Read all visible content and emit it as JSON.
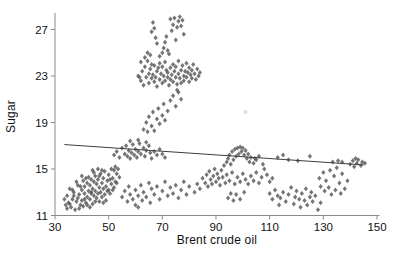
{
  "chart_data": {
    "type": "scatter",
    "title": "",
    "xlabel": "Brent crude oil",
    "ylabel": "Sugar",
    "xlim": [
      30,
      150
    ],
    "ylim": [
      11,
      28.3
    ],
    "x_ticks": [
      30,
      50,
      70,
      90,
      110,
      130,
      150
    ],
    "y_ticks": [
      11,
      15,
      19,
      23,
      27
    ],
    "grid": false,
    "legend": "none",
    "marker": {
      "shape": "diamond",
      "color": "#57575a",
      "size": 4
    },
    "axis_color": "#8a8a8a",
    "text_color": "#111111",
    "trendline": {
      "x1": 33.5,
      "y1": 17.1,
      "x2": 145,
      "y2": 15.35,
      "color": "#3d3d3d"
    },
    "points": [
      [
        33.5,
        12.4
      ],
      [
        34,
        11.9
      ],
      [
        34.5,
        12.7
      ],
      [
        35,
        12.1
      ],
      [
        35.5,
        13.3
      ],
      [
        36,
        11.7
      ],
      [
        36.5,
        12.4
      ],
      [
        37,
        13.0
      ],
      [
        37.5,
        11.5
      ],
      [
        38,
        12.2
      ],
      [
        38.5,
        13.6
      ],
      [
        39,
        12.8
      ],
      [
        39.5,
        11.9
      ],
      [
        40,
        13.2
      ],
      [
        40,
        12.3
      ],
      [
        40.5,
        14.0
      ],
      [
        41,
        12.9
      ],
      [
        41,
        13.5
      ],
      [
        41.5,
        12.1
      ],
      [
        42,
        13.8
      ],
      [
        42,
        12.6
      ],
      [
        42.5,
        13.1
      ],
      [
        42.5,
        14.3
      ],
      [
        43,
        12.4
      ],
      [
        43,
        13.6
      ],
      [
        43.5,
        12.9
      ],
      [
        43.5,
        14.1
      ],
      [
        44,
        13.3
      ],
      [
        44,
        12.0
      ],
      [
        44.5,
        13.9
      ],
      [
        44.5,
        12.7
      ],
      [
        45,
        14.4
      ],
      [
        45,
        13.1
      ],
      [
        45.5,
        12.5
      ],
      [
        45.5,
        13.7
      ],
      [
        46,
        14.1
      ],
      [
        46,
        12.9
      ],
      [
        46.5,
        13.4
      ],
      [
        46.5,
        12.2
      ],
      [
        47,
        14.6
      ],
      [
        47,
        13.0
      ],
      [
        47.5,
        13.8
      ],
      [
        47.5,
        12.6
      ],
      [
        48,
        14.2
      ],
      [
        48,
        13.3
      ],
      [
        48.5,
        12.8
      ],
      [
        48.5,
        14.8
      ],
      [
        49,
        13.5
      ],
      [
        49,
        12.3
      ],
      [
        49.5,
        14.0
      ],
      [
        50,
        13.2
      ],
      [
        50,
        14.5
      ],
      [
        50.5,
        12.9
      ],
      [
        51,
        13.7
      ],
      [
        51,
        15.0
      ],
      [
        51.5,
        14.2
      ],
      [
        52,
        13.4
      ],
      [
        52,
        14.9
      ],
      [
        52.5,
        15.2
      ],
      [
        53,
        14.6
      ],
      [
        53.5,
        15.0
      ],
      [
        54,
        14.3
      ],
      [
        39,
        11.6
      ],
      [
        40.5,
        11.8
      ],
      [
        43,
        11.7
      ],
      [
        37,
        12.7
      ],
      [
        38,
        13.9
      ],
      [
        36.5,
        13.2
      ],
      [
        35.5,
        12.0
      ],
      [
        48,
        12.1
      ],
      [
        50.5,
        14.1
      ],
      [
        41.5,
        14.2
      ],
      [
        44.5,
        14.7
      ],
      [
        46,
        15.0
      ],
      [
        49.5,
        13.1
      ],
      [
        34.5,
        11.6
      ],
      [
        52.5,
        13.9
      ],
      [
        42,
        11.9
      ],
      [
        45,
        12.2
      ],
      [
        47.5,
        14.9
      ],
      [
        39.5,
        13.5
      ],
      [
        41,
        12.4
      ],
      [
        43.5,
        13.0
      ],
      [
        51.5,
        13.2
      ],
      [
        38.5,
        12.5
      ],
      [
        40,
        14.4
      ],
      [
        44,
        14.9
      ],
      [
        46.5,
        14.4
      ],
      [
        53,
        13.8
      ],
      [
        52,
        16.2
      ],
      [
        53,
        16.5
      ],
      [
        54,
        16.0
      ],
      [
        55,
        16.8
      ],
      [
        56,
        16.3
      ],
      [
        56.5,
        17.0
      ],
      [
        57,
        16.1
      ],
      [
        57.5,
        16.6
      ],
      [
        58,
        15.9
      ],
      [
        58.5,
        16.4
      ],
      [
        59,
        17.1
      ],
      [
        59.5,
        16.2
      ],
      [
        60,
        16.7
      ],
      [
        60.5,
        16.0
      ],
      [
        61,
        16.5
      ],
      [
        61.5,
        17.2
      ],
      [
        62,
        16.3
      ],
      [
        63,
        16.8
      ],
      [
        63.5,
        16.1
      ],
      [
        64,
        16.6
      ],
      [
        65,
        17.0
      ],
      [
        65.5,
        16.4
      ],
      [
        66,
        15.9
      ],
      [
        67,
        16.5
      ],
      [
        68,
        16.2
      ],
      [
        69,
        16.7
      ],
      [
        70,
        16.3
      ],
      [
        71,
        16.0
      ],
      [
        58,
        17.4
      ],
      [
        61,
        17.5
      ],
      [
        64,
        17.3
      ],
      [
        63,
        18.4
      ],
      [
        64,
        19.0
      ],
      [
        64.5,
        18.2
      ],
      [
        65,
        19.5
      ],
      [
        66,
        18.7
      ],
      [
        66.5,
        19.9
      ],
      [
        67,
        18.3
      ],
      [
        68,
        19.3
      ],
      [
        68.5,
        20.2
      ],
      [
        69,
        18.9
      ],
      [
        70,
        19.6
      ],
      [
        70.5,
        20.6
      ],
      [
        71,
        19.2
      ],
      [
        72,
        20.0
      ],
      [
        73,
        20.9
      ],
      [
        74,
        21.3
      ],
      [
        75,
        20.4
      ],
      [
        76,
        21.6
      ],
      [
        77,
        21.0
      ],
      [
        75.5,
        21.8
      ],
      [
        61,
        23.0
      ],
      [
        62,
        22.6
      ],
      [
        62.5,
        23.4
      ],
      [
        63,
        22.2
      ],
      [
        63.5,
        23.8
      ],
      [
        64,
        22.9
      ],
      [
        64.5,
        24.3
      ],
      [
        65,
        23.2
      ],
      [
        65,
        22.4
      ],
      [
        65.5,
        23.6
      ],
      [
        66,
        22.8
      ],
      [
        66,
        24.0
      ],
      [
        66.5,
        23.1
      ],
      [
        67,
        22.5
      ],
      [
        67,
        23.9
      ],
      [
        67.5,
        22.9
      ],
      [
        68,
        23.4
      ],
      [
        68,
        22.1
      ],
      [
        68.5,
        23.7
      ],
      [
        69,
        22.7
      ],
      [
        69,
        24.1
      ],
      [
        69.5,
        23.2
      ],
      [
        70,
        22.4
      ],
      [
        70,
        23.8
      ],
      [
        70.5,
        23.0
      ],
      [
        71,
        22.6
      ],
      [
        71,
        24.2
      ],
      [
        71.5,
        23.5
      ],
      [
        72,
        22.9
      ],
      [
        72,
        23.3
      ],
      [
        72.5,
        22.2
      ],
      [
        73,
        23.7
      ],
      [
        73,
        22.7
      ],
      [
        73.5,
        23.1
      ],
      [
        74,
        24.0
      ],
      [
        74,
        22.5
      ],
      [
        74.5,
        23.4
      ],
      [
        75,
        22.9
      ],
      [
        75,
        23.8
      ],
      [
        75.5,
        22.3
      ],
      [
        76,
        23.2
      ],
      [
        76,
        24.3
      ],
      [
        76.5,
        22.8
      ],
      [
        77,
        23.5
      ],
      [
        77,
        22.4
      ],
      [
        77.5,
        23.9
      ],
      [
        78,
        23.0
      ],
      [
        78,
        22.6
      ],
      [
        78.5,
        23.4
      ],
      [
        79,
        24.1
      ],
      [
        79,
        22.9
      ],
      [
        79.5,
        23.3
      ],
      [
        80,
        22.5
      ],
      [
        80,
        23.7
      ],
      [
        80.5,
        23.1
      ],
      [
        81,
        22.8
      ],
      [
        81,
        23.5
      ],
      [
        81.5,
        24.0
      ],
      [
        82,
        23.2
      ],
      [
        82.5,
        22.7
      ],
      [
        83,
        23.6
      ],
      [
        83.5,
        23.0
      ],
      [
        84,
        23.3
      ],
      [
        63.5,
        24.6
      ],
      [
        64.5,
        25.0
      ],
      [
        65.5,
        24.8
      ],
      [
        62,
        24.2
      ],
      [
        61.5,
        22.9
      ],
      [
        66.5,
        27.6
      ],
      [
        66,
        26.8
      ],
      [
        67,
        27.1
      ],
      [
        67.5,
        26.3
      ],
      [
        68,
        25.8
      ],
      [
        71,
        25.9
      ],
      [
        71.5,
        26.4
      ],
      [
        72,
        25.2
      ],
      [
        73,
        27.9
      ],
      [
        73.5,
        26.9
      ],
      [
        74,
        27.4
      ],
      [
        75,
        26.1
      ],
      [
        75.5,
        27.2
      ],
      [
        76,
        27.7
      ],
      [
        77,
        27.3
      ],
      [
        77.5,
        27.8
      ],
      [
        78,
        26.6
      ],
      [
        72.5,
        24.9
      ],
      [
        70.5,
        25.4
      ],
      [
        69,
        24.7
      ],
      [
        70,
        25.0
      ],
      [
        74.5,
        28.0
      ],
      [
        76.5,
        28.1
      ],
      [
        55,
        12.6
      ],
      [
        56,
        13.1
      ],
      [
        57,
        12.2
      ],
      [
        57.5,
        13.5
      ],
      [
        58,
        12.8
      ],
      [
        59,
        12.4
      ],
      [
        60,
        13.2
      ],
      [
        60,
        11.9
      ],
      [
        61,
        12.7
      ],
      [
        62,
        13.6
      ],
      [
        62.5,
        12.3
      ],
      [
        63,
        13.0
      ],
      [
        64,
        12.6
      ],
      [
        65,
        13.8
      ],
      [
        65.5,
        12.1
      ],
      [
        66,
        13.3
      ],
      [
        67,
        12.8
      ],
      [
        68,
        13.5
      ],
      [
        69,
        12.4
      ],
      [
        70,
        13.1
      ],
      [
        71,
        13.9
      ],
      [
        72,
        12.7
      ],
      [
        73,
        13.4
      ],
      [
        74,
        12.9
      ],
      [
        75,
        13.6
      ],
      [
        76,
        12.5
      ],
      [
        77,
        13.2
      ],
      [
        78,
        13.9
      ],
      [
        79,
        12.8
      ],
      [
        80,
        13.5
      ],
      [
        82,
        13.0
      ],
      [
        83,
        13.7
      ],
      [
        84,
        13.3
      ],
      [
        61,
        11.7
      ],
      [
        93,
        15.3
      ],
      [
        94,
        15.6
      ],
      [
        94.5,
        15.9
      ],
      [
        95,
        16.2
      ],
      [
        95.5,
        15.4
      ],
      [
        96,
        16.5
      ],
      [
        96.5,
        15.8
      ],
      [
        97,
        16.7
      ],
      [
        97.5,
        16.1
      ],
      [
        98,
        16.8
      ],
      [
        98.5,
        16.3
      ],
      [
        99,
        16.9
      ],
      [
        99.5,
        16.5
      ],
      [
        100,
        16.8
      ],
      [
        100.5,
        16.2
      ],
      [
        101,
        16.6
      ],
      [
        101.5,
        15.9
      ],
      [
        102,
        16.3
      ],
      [
        102.5,
        15.6
      ],
      [
        103,
        16.0
      ],
      [
        104,
        15.5
      ],
      [
        105,
        15.8
      ],
      [
        85,
        14.2
      ],
      [
        86,
        13.8
      ],
      [
        86.5,
        14.5
      ],
      [
        87,
        13.5
      ],
      [
        87.5,
        14.8
      ],
      [
        88,
        14.1
      ],
      [
        88.5,
        13.7
      ],
      [
        89,
        14.4
      ],
      [
        89.5,
        15.0
      ],
      [
        90,
        13.9
      ],
      [
        90.5,
        14.6
      ],
      [
        91,
        14.2
      ],
      [
        91.5,
        13.6
      ],
      [
        92,
        14.9
      ],
      [
        92.5,
        14.3
      ],
      [
        93.5,
        13.8
      ],
      [
        94,
        14.5
      ],
      [
        95,
        14.0
      ],
      [
        96,
        14.7
      ],
      [
        97,
        13.7
      ],
      [
        98,
        14.3
      ],
      [
        99,
        13.9
      ],
      [
        100,
        14.6
      ],
      [
        101,
        14.1
      ],
      [
        102,
        13.7
      ],
      [
        103,
        14.4
      ],
      [
        104,
        14.0
      ],
      [
        105,
        14.7
      ],
      [
        106,
        13.8
      ],
      [
        107,
        14.3
      ],
      [
        108,
        15.0
      ],
      [
        109,
        14.5
      ],
      [
        110,
        13.9
      ],
      [
        111,
        14.2
      ],
      [
        94.5,
        12.5
      ],
      [
        95.5,
        12.9
      ],
      [
        96.5,
        12.3
      ],
      [
        97.5,
        12.8
      ],
      [
        99,
        12.4
      ],
      [
        100.5,
        13.0
      ],
      [
        110,
        12.9
      ],
      [
        111,
        12.4
      ],
      [
        112,
        13.2
      ],
      [
        113,
        12.7
      ],
      [
        113.5,
        11.9
      ],
      [
        114,
        12.5
      ],
      [
        115,
        13.0
      ],
      [
        116,
        12.2
      ],
      [
        117,
        12.8
      ],
      [
        118,
        13.4
      ],
      [
        119,
        12.0
      ],
      [
        119.5,
        12.6
      ],
      [
        120,
        13.1
      ],
      [
        121,
        12.4
      ],
      [
        121.5,
        11.7
      ],
      [
        122,
        12.9
      ],
      [
        123,
        12.3
      ],
      [
        123.5,
        13.3
      ],
      [
        124,
        11.9
      ],
      [
        125,
        12.6
      ],
      [
        125.5,
        13.0
      ],
      [
        126,
        12.2
      ],
      [
        127,
        12.7
      ],
      [
        128,
        11.5
      ],
      [
        129,
        12.1
      ],
      [
        128.5,
        14.2
      ],
      [
        129,
        13.5
      ],
      [
        130,
        14.7
      ],
      [
        130.5,
        13.1
      ],
      [
        131,
        14.0
      ],
      [
        132,
        13.4
      ],
      [
        132.5,
        14.9
      ],
      [
        133,
        12.8
      ],
      [
        134,
        14.4
      ],
      [
        134.5,
        13.2
      ],
      [
        135,
        15.1
      ],
      [
        136,
        13.8
      ],
      [
        136.5,
        12.9
      ],
      [
        137,
        14.6
      ],
      [
        138,
        13.3
      ],
      [
        139,
        14.0
      ],
      [
        113,
        16.0
      ],
      [
        115,
        16.2
      ],
      [
        117,
        15.8
      ],
      [
        120.5,
        15.7
      ],
      [
        125,
        16.1
      ],
      [
        133.5,
        15.6
      ],
      [
        135.5,
        15.7
      ],
      [
        137,
        15.6
      ],
      [
        104.5,
        15.9
      ],
      [
        106,
        16.1
      ],
      [
        107.5,
        15.4
      ],
      [
        140,
        15.4
      ],
      [
        141,
        15.7
      ],
      [
        141.5,
        15.2
      ],
      [
        142,
        15.9
      ],
      [
        142.5,
        15.5
      ],
      [
        143,
        15.8
      ],
      [
        144,
        15.3
      ],
      [
        144.5,
        15.6
      ],
      [
        145.5,
        15.5
      ]
    ],
    "faint_points": [
      [
        101,
        19.9
      ]
    ]
  }
}
